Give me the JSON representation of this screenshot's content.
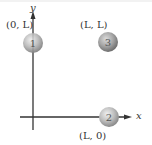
{
  "diagram": {
    "axes": {
      "x_label": "x",
      "y_label": "y",
      "color": "#333333"
    },
    "particles": [
      {
        "id": "1",
        "label": "1",
        "coord_label": "(0, L)",
        "cx": 33,
        "cy": 43,
        "r": 10
      },
      {
        "id": "2",
        "label": "2",
        "coord_label": "(L, 0)",
        "cx": 109,
        "cy": 117,
        "r": 10
      },
      {
        "id": "3",
        "label": "3",
        "coord_label": "(L, L)",
        "cx": 108,
        "cy": 42,
        "r": 10
      }
    ],
    "colors": {
      "sphere_light": "#e6e6e6",
      "sphere_mid": "#bdbdbd",
      "sphere_dark": "#8f8f8f",
      "sphere_3_mid": "#a8a8a8",
      "sphere_3_dark": "#7a7a7a"
    }
  }
}
